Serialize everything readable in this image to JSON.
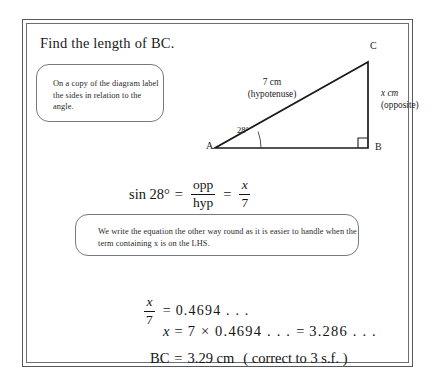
{
  "question": {
    "title": "Find the length of BC."
  },
  "callouts": [
    {
      "name": "label-sides",
      "text": "On a copy of the diagram label the sides in relation to the angle."
    },
    {
      "name": "rearrange",
      "text": "We write the equation the other way round as it is easier to handle when the term containing x is on the LHS."
    }
  ],
  "diagram": {
    "vertices": {
      "a": "A",
      "b": "B",
      "c": "C"
    },
    "angle_label": "28°",
    "hypotenuse_label_line1": "7 cm",
    "hypotenuse_label_line2": "(hypotenuse)",
    "opposite_label_line1": "x cm",
    "opposite_label_line2": "(opposite)",
    "right_angle_at": "B"
  },
  "equations": {
    "sin": {
      "lhs": "sin 28°",
      "equals": "=",
      "frac1_num": "opp",
      "frac1_den": "hyp",
      "equals2": "=",
      "frac2_num": "x",
      "frac2_den": "7"
    },
    "frac_x7": {
      "num": "x",
      "den": "7",
      "equals": "=",
      "value": "0.4694 . . ."
    },
    "x_value": {
      "lhs": "x",
      "equals": "=",
      "rhs": "7 × 0.4694 . . .",
      "equals2": "=",
      "result": "3.286 . . ."
    },
    "bc_result": {
      "lhs": "BC",
      "equals": "=",
      "value": "3.29 cm",
      "note": "( correct to 3 s.f. )"
    }
  },
  "colors": {
    "ink": "#1a1a1a",
    "rule": "#55585c",
    "callout_border": "#757a80"
  }
}
